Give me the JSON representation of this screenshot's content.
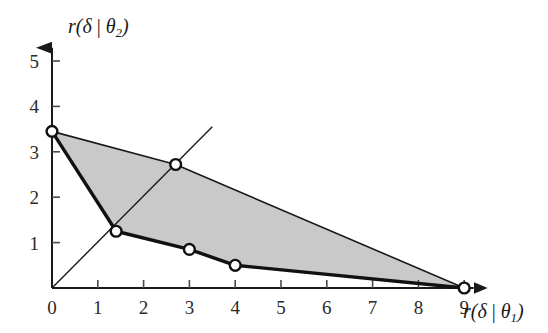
{
  "chart_data": {
    "type": "line",
    "title": "",
    "subtitle": "",
    "xlabel": "r(δ | θ₁)",
    "ylabel": "r(δ | θ₂)",
    "xlim": [
      0,
      9.6
    ],
    "ylim": [
      0,
      5.6
    ],
    "grid": false,
    "legend": "none",
    "x_ticks": [
      "0",
      "1",
      "2",
      "3",
      "4",
      "5",
      "6",
      "7",
      "8",
      "9"
    ],
    "x_tick_values": [
      0,
      1,
      2,
      3,
      4,
      5,
      6,
      7,
      8,
      9
    ],
    "y_ticks": [
      "1",
      "2",
      "3",
      "4",
      "5"
    ],
    "y_tick_values": [
      1,
      2,
      3,
      4,
      5
    ],
    "series": [
      {
        "name": "risk-set-region",
        "kind": "filled-polygon",
        "fill": "#c9c9c9",
        "points": [
          {
            "x": 0,
            "y": 3.45
          },
          {
            "x": 2.7,
            "y": 2.72
          },
          {
            "x": 9,
            "y": 0
          },
          {
            "x": 4,
            "y": 0.5
          },
          {
            "x": 3,
            "y": 0.85
          },
          {
            "x": 1.4,
            "y": 1.25
          }
        ]
      },
      {
        "name": "lower-boundary-minimax-rules",
        "kind": "thick-line",
        "points": [
          {
            "x": 0,
            "y": 3.45
          },
          {
            "x": 1.4,
            "y": 1.25
          },
          {
            "x": 3,
            "y": 0.85
          },
          {
            "x": 4,
            "y": 0.5
          },
          {
            "x": 9,
            "y": 0
          }
        ]
      },
      {
        "name": "upper-boundary",
        "kind": "thin-line",
        "points": [
          {
            "x": 0,
            "y": 3.45
          },
          {
            "x": 2.7,
            "y": 2.72
          },
          {
            "x": 9,
            "y": 0
          }
        ]
      },
      {
        "name": "equal-risk-diagonal",
        "kind": "thin-line",
        "points": [
          {
            "x": 0,
            "y": 0
          },
          {
            "x": 3.5,
            "y": 3.55
          }
        ]
      }
    ],
    "markers": [
      {
        "label": "vertex-y-intercept",
        "x": 0,
        "y": 3.45
      },
      {
        "label": "vertex-kink",
        "x": 1.4,
        "y": 1.25
      },
      {
        "label": "diagonal-intersection",
        "x": 2.7,
        "y": 2.72
      },
      {
        "label": "point-x3",
        "x": 3,
        "y": 0.85
      },
      {
        "label": "point-x4",
        "x": 4,
        "y": 0.5
      },
      {
        "label": "vertex-x-intercept",
        "x": 9,
        "y": 0
      }
    ],
    "annotations": []
  },
  "axes": {
    "x_axis_name": "horizontal-risk-axis",
    "y_axis_name": "vertical-risk-axis"
  }
}
